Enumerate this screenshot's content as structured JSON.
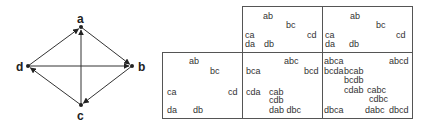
{
  "graph": {
    "nodes": [
      {
        "id": "a",
        "label": "a",
        "x": 81,
        "y": 27
      },
      {
        "id": "b",
        "label": "b",
        "x": 132,
        "y": 66
      },
      {
        "id": "c",
        "label": "c",
        "x": 81,
        "y": 105
      },
      {
        "id": "d",
        "label": "d",
        "x": 28,
        "y": 66
      }
    ],
    "edges": [
      {
        "from": "d",
        "to": "a"
      },
      {
        "from": "a",
        "to": "b"
      },
      {
        "from": "b",
        "to": "c"
      },
      {
        "from": "c",
        "to": "d"
      },
      {
        "from": "c",
        "to": "a"
      },
      {
        "from": "d",
        "to": "b"
      }
    ]
  },
  "tables": {
    "top_left": {
      "labels": [
        {
          "text": "ab",
          "x": 263,
          "y": 12
        },
        {
          "text": "bc",
          "x": 286,
          "y": 21
        },
        {
          "text": "ca",
          "x": 245,
          "y": 31
        },
        {
          "text": "cd",
          "x": 307,
          "y": 31
        },
        {
          "text": "da",
          "x": 245,
          "y": 40
        },
        {
          "text": "db",
          "x": 264,
          "y": 40
        }
      ]
    },
    "top_right": {
      "labels": [
        {
          "text": "ab",
          "x": 350,
          "y": 12
        },
        {
          "text": "bc",
          "x": 376,
          "y": 21
        },
        {
          "text": "ca",
          "x": 325,
          "y": 31
        },
        {
          "text": "cd",
          "x": 396,
          "y": 31
        },
        {
          "text": "da",
          "x": 325,
          "y": 40
        },
        {
          "text": "db",
          "x": 349,
          "y": 40
        }
      ]
    },
    "bottom_left": {
      "labels": [
        {
          "text": "ab",
          "x": 189,
          "y": 57
        },
        {
          "text": "bc",
          "x": 210,
          "y": 67
        },
        {
          "text": "ca",
          "x": 167,
          "y": 88
        },
        {
          "text": "cd",
          "x": 228,
          "y": 88
        },
        {
          "text": "da",
          "x": 167,
          "y": 106
        },
        {
          "text": "db",
          "x": 193,
          "y": 106
        }
      ]
    },
    "bottom_middle": {
      "labels": [
        {
          "text": "abc",
          "x": 284,
          "y": 57
        },
        {
          "text": "bca",
          "x": 246,
          "y": 67
        },
        {
          "text": "bcd",
          "x": 304,
          "y": 67
        },
        {
          "text": "cda",
          "x": 246,
          "y": 88
        },
        {
          "text": "cab",
          "x": 269,
          "y": 88
        },
        {
          "text": "cdb",
          "x": 269,
          "y": 96
        },
        {
          "text": "dab dbc",
          "x": 269,
          "y": 106
        }
      ]
    },
    "bottom_right": {
      "labels": [
        {
          "text": "abca",
          "x": 324,
          "y": 57
        },
        {
          "text": "abcd",
          "x": 389,
          "y": 57
        },
        {
          "text": "bcda",
          "x": 324,
          "y": 67
        },
        {
          "text": "bcab",
          "x": 344,
          "y": 67
        },
        {
          "text": "bcdb",
          "x": 344,
          "y": 76
        },
        {
          "text": "cdab",
          "x": 344,
          "y": 86
        },
        {
          "text": "cabc",
          "x": 367,
          "y": 86
        },
        {
          "text": "cdbc",
          "x": 369,
          "y": 95
        },
        {
          "text": "dbca",
          "x": 324,
          "y": 106
        },
        {
          "text": "dabc",
          "x": 365,
          "y": 106
        },
        {
          "text": "dbcd",
          "x": 389,
          "y": 106
        }
      ]
    }
  }
}
